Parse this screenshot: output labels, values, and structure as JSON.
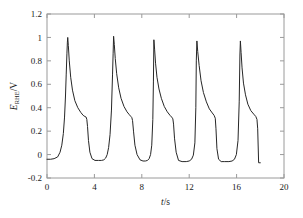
{
  "chart_data": {
    "type": "line",
    "title": "",
    "subtitle": "",
    "xlabel": "t/s",
    "ylabel": "E_RHE/V",
    "ylabel_parts": {
      "main": "E",
      "sub": "RHE",
      "unit": "/V"
    },
    "xlabel_parts": {
      "main": "t",
      "unit": "/s"
    },
    "xlim": [
      0,
      20
    ],
    "ylim": [
      -0.2,
      1.2
    ],
    "xticks": [
      0,
      4,
      8,
      12,
      16,
      20
    ],
    "xtick_labels": [
      "0",
      "4",
      "8",
      "12",
      "16",
      "20"
    ],
    "yticks": [
      -0.2,
      0,
      0.2,
      0.4,
      0.6,
      0.8,
      1,
      1.2
    ],
    "ytick_labels": [
      "-0.2",
      "0",
      "0.2",
      "0.4",
      "0.6",
      "0.8",
      "1",
      "1.2"
    ],
    "grid": false,
    "legend": null,
    "legend_position": "none",
    "line_color": "#262626",
    "line_width": 1.0,
    "frame_color": "#9a9a9a",
    "background": "#ffffff",
    "peaks": [
      {
        "t": 1.75,
        "v": 1.0
      },
      {
        "t": 5.6,
        "v": 1.01
      },
      {
        "t": 9.0,
        "v": 0.98
      },
      {
        "t": 12.6,
        "v": 0.97
      },
      {
        "t": 16.3,
        "v": 0.97
      }
    ],
    "baseline_value": -0.05,
    "shoulder_value": 0.3,
    "series": [
      {
        "name": "E_RHE",
        "x": [
          0.0,
          0.3,
          0.6,
          0.9,
          1.1,
          1.25,
          1.38,
          1.48,
          1.56,
          1.62,
          1.68,
          1.72,
          1.75,
          1.8,
          1.88,
          2.0,
          2.15,
          2.35,
          2.6,
          2.85,
          3.05,
          3.2,
          3.3,
          3.36,
          3.42,
          3.5,
          3.62,
          3.8,
          4.05,
          4.35,
          4.6,
          4.8,
          4.95,
          5.08,
          5.2,
          5.32,
          5.44,
          5.53,
          5.58,
          5.62,
          5.68,
          5.76,
          5.88,
          6.05,
          6.25,
          6.5,
          6.75,
          6.95,
          7.08,
          7.16,
          7.22,
          7.3,
          7.42,
          7.6,
          7.85,
          8.1,
          8.3,
          8.48,
          8.62,
          8.74,
          8.84,
          8.93,
          8.98,
          9.02,
          9.08,
          9.16,
          9.28,
          9.45,
          9.65,
          9.9,
          10.15,
          10.38,
          10.52,
          10.62,
          10.68,
          10.76,
          10.9,
          11.1,
          11.4,
          11.75,
          12.0,
          12.2,
          12.35,
          12.48,
          12.56,
          12.6,
          12.65,
          12.72,
          12.84,
          13.0,
          13.2,
          13.45,
          13.7,
          13.95,
          14.1,
          14.2,
          14.26,
          14.34,
          14.48,
          14.7,
          15.0,
          15.35,
          15.62,
          15.82,
          15.98,
          16.12,
          16.22,
          16.28,
          16.32,
          16.38,
          16.46,
          16.58,
          16.75,
          16.95,
          17.2,
          17.45,
          17.62,
          17.72,
          17.78,
          17.86,
          18.0
        ],
        "y": [
          -0.04,
          -0.04,
          -0.035,
          -0.02,
          0.02,
          0.08,
          0.18,
          0.32,
          0.5,
          0.68,
          0.86,
          0.96,
          1.0,
          0.93,
          0.8,
          0.66,
          0.55,
          0.46,
          0.4,
          0.36,
          0.335,
          0.325,
          0.32,
          0.3,
          0.24,
          0.12,
          0.02,
          -0.035,
          -0.05,
          -0.05,
          -0.05,
          -0.045,
          -0.03,
          0.0,
          0.06,
          0.17,
          0.38,
          0.68,
          0.86,
          1.01,
          0.94,
          0.82,
          0.69,
          0.57,
          0.48,
          0.41,
          0.365,
          0.34,
          0.325,
          0.315,
          0.29,
          0.2,
          0.08,
          0.0,
          -0.045,
          -0.055,
          -0.055,
          -0.05,
          -0.035,
          0.0,
          0.08,
          0.3,
          0.62,
          0.98,
          0.9,
          0.78,
          0.66,
          0.56,
          0.48,
          0.41,
          0.365,
          0.335,
          0.32,
          0.305,
          0.26,
          0.14,
          0.02,
          -0.05,
          -0.06,
          -0.06,
          -0.055,
          -0.04,
          -0.005,
          0.1,
          0.4,
          0.8,
          0.97,
          0.88,
          0.76,
          0.63,
          0.53,
          0.45,
          0.39,
          0.355,
          0.335,
          0.31,
          0.22,
          0.05,
          -0.04,
          -0.06,
          -0.06,
          -0.06,
          -0.055,
          -0.04,
          0.0,
          0.12,
          0.45,
          0.85,
          0.97,
          0.87,
          0.74,
          0.61,
          0.51,
          0.43,
          0.375,
          0.345,
          0.325,
          0.3,
          0.22,
          -0.07,
          -0.07
        ]
      }
    ]
  }
}
